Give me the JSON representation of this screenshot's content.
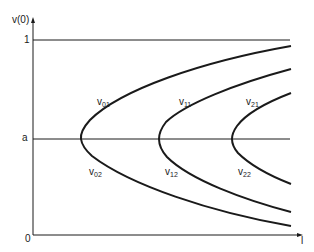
{
  "diagram": {
    "y_axis_label": "v(0)",
    "x_axis_label": "l",
    "origin_label": "0",
    "y_tick_one": "1",
    "y_tick_a": "a",
    "curves": [
      {
        "label_main": "v",
        "label_sub": "01"
      },
      {
        "label_main": "v",
        "label_sub": "02"
      },
      {
        "label_main": "v",
        "label_sub": "11"
      },
      {
        "label_main": "v",
        "label_sub": "12"
      },
      {
        "label_main": "v",
        "label_sub": "21"
      },
      {
        "label_main": "v",
        "label_sub": "22"
      }
    ],
    "colors": {
      "line": "#1a1a1a",
      "background": "#ffffff"
    }
  }
}
